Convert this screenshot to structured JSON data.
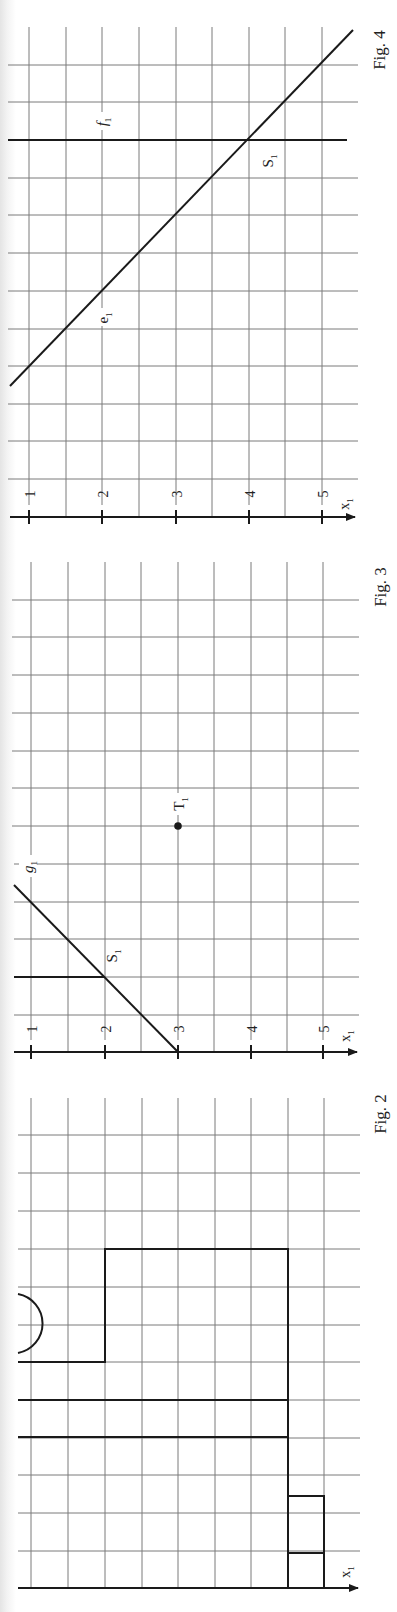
{
  "figures": [
    {
      "id": "fig4",
      "caption": "Fig. 4",
      "axis_label": "x",
      "axis_subscript": "1",
      "ticks": [
        "1",
        "2",
        "3",
        "4",
        "5"
      ],
      "lines": [
        {
          "name": "e",
          "subscript": "1"
        },
        {
          "name": "f",
          "subscript": "1"
        }
      ],
      "points": [
        {
          "name": "S",
          "subscript": "1"
        }
      ]
    },
    {
      "id": "fig3",
      "caption": "Fig. 3",
      "axis_label": "x",
      "axis_subscript": "1",
      "ticks": [
        "1",
        "2",
        "3",
        "4",
        "5"
      ],
      "lines": [
        {
          "name": "g",
          "subscript": "1"
        }
      ],
      "points": [
        {
          "name": "S",
          "subscript": "1"
        },
        {
          "name": "T",
          "subscript": "1"
        }
      ]
    },
    {
      "id": "fig2",
      "caption": "Fig. 2",
      "axis_label": "x",
      "axis_subscript": "1"
    }
  ],
  "colors": {
    "grid": "#7a7a7a",
    "ink": "#1a1a1a",
    "paper": "#ffffff"
  }
}
